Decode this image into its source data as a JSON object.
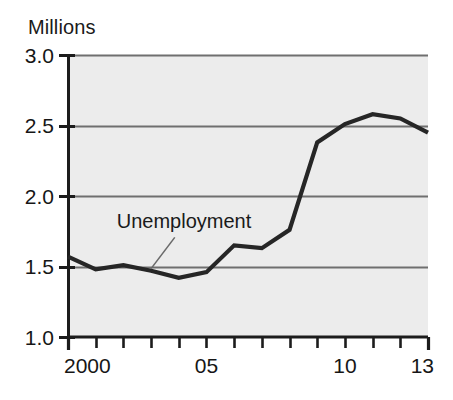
{
  "chart_data": {
    "type": "line",
    "title": "",
    "subtitle": "",
    "xlabel": "",
    "ylabel": "Millions",
    "ylim": [
      1.0,
      3.0
    ],
    "xlim": [
      2000,
      2013
    ],
    "grid": true,
    "grid_axis": "y",
    "legend_position": "inline-annotation",
    "y_ticks": [
      "3.0",
      "2.5",
      "2.0",
      "1.5",
      "1.0"
    ],
    "y_tick_values": [
      3.0,
      2.5,
      2.0,
      1.5,
      1.0
    ],
    "x_ticks_labeled": [
      "2000",
      "05",
      "10",
      "13"
    ],
    "x_tick_label_values": [
      2000,
      2005,
      2010,
      2013
    ],
    "x_tick_values": [
      2000,
      2001,
      2002,
      2003,
      2004,
      2005,
      2006,
      2007,
      2008,
      2009,
      2010,
      2011,
      2012,
      2013
    ],
    "annotations": [
      {
        "text": "Unemployment",
        "x": 2004,
        "y": 1.82
      }
    ],
    "series": [
      {
        "name": "Unemployment",
        "color": "#262626",
        "x": [
          2000,
          2001,
          2002,
          2003,
          2004,
          2005,
          2006,
          2007,
          2008,
          2009,
          2010,
          2011,
          2012,
          2013
        ],
        "values": [
          1.57,
          1.48,
          1.51,
          1.47,
          1.42,
          1.46,
          1.65,
          1.63,
          1.76,
          2.38,
          2.51,
          2.58,
          2.55,
          2.45
        ]
      }
    ]
  },
  "labels": {
    "y_axis_unit": "Millions",
    "series_callout": "Unemployment"
  },
  "colors": {
    "plot_background": "#ececec",
    "gridline": "#6f6f6f",
    "axis": "#1c1c1c",
    "series_line": "#262626",
    "text": "#161616",
    "page_background": "#ffffff",
    "leader_line": "#6a6a6a"
  }
}
